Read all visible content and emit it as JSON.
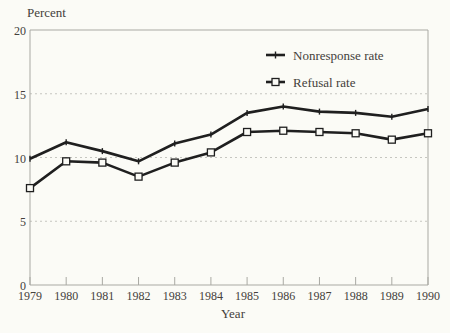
{
  "figure": {
    "background": "#fbfbf6",
    "text_color": "#44413b",
    "line_color": "#1f1f1f",
    "grid_color": "#c6c6c0",
    "axis_color": "#a9a9a3"
  },
  "chart_data": {
    "type": "line",
    "title": "",
    "ylabel": "Percent",
    "xlabel": "Year",
    "x": [
      "1979",
      "1980",
      "1981",
      "1982",
      "1983",
      "1984",
      "1985",
      "1986",
      "1987",
      "1988",
      "1989",
      "1990"
    ],
    "ylim": [
      0,
      20
    ],
    "yticks": [
      0,
      5,
      10,
      15,
      20
    ],
    "grid": "horizontal dashed gridlines at 5, 10, 15; solid frame at 0 and 20",
    "legend_position": "inside plot, upper middle",
    "series": [
      {
        "name": "Nonresponse rate",
        "marker": "tick",
        "values": [
          9.9,
          11.2,
          10.5,
          9.7,
          11.1,
          11.8,
          13.5,
          14.0,
          13.6,
          13.5,
          13.2,
          13.8
        ]
      },
      {
        "name": "Refusal rate",
        "marker": "open-square",
        "values": [
          7.6,
          9.7,
          9.6,
          8.5,
          9.6,
          10.4,
          12.0,
          12.1,
          12.0,
          11.9,
          11.4,
          11.9
        ]
      }
    ]
  }
}
